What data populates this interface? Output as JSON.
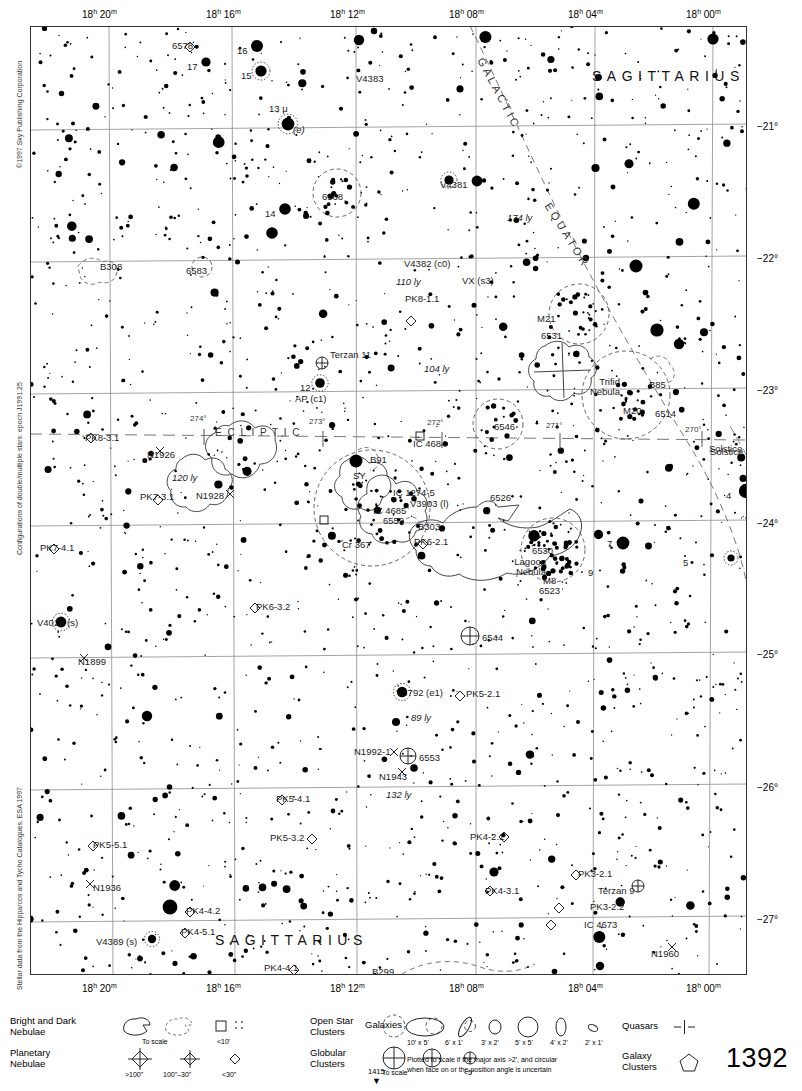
{
  "meta": {
    "page_number": "1392",
    "bottom_tiny_number": "1415",
    "copyright": "©1997 Sky Publishing Corporation",
    "credit_double_stars": "Configurations of double/multiple stars: epoch J1991.25",
    "credit_stellar_data": "Stellar data from the Hipparcos and Tycho Catalogues, ESA 1997"
  },
  "chart_data": {
    "type": "scatter",
    "xlabel": "Right Ascension",
    "ylabel": "Declination",
    "x_ticks": [
      "18h 20m",
      "18h 16m",
      "18h 12m",
      "18h 08m",
      "18h 04m",
      "18h 00m"
    ],
    "y_ticks": [
      "-21°",
      "-22°",
      "-23°",
      "-24°",
      "-25°",
      "-26°",
      "-27°"
    ],
    "xlim": [
      "18h 22m",
      "17h 59m"
    ],
    "ylim": [
      -27.4,
      -20.4
    ],
    "grid": true,
    "legend_position": "below-chart"
  },
  "ra_ticks": [
    {
      "label": "18",
      "sup_h": "h",
      "min": "20",
      "sup_m": "m",
      "x": 108
    },
    {
      "label": "18",
      "sup_h": "h",
      "min": "16",
      "sup_m": "m",
      "x": 232
    },
    {
      "label": "18",
      "sup_h": "h",
      "min": "12",
      "sup_m": "m",
      "x": 356
    },
    {
      "label": "18",
      "sup_h": "h",
      "min": "08",
      "sup_m": "m",
      "x": 475
    },
    {
      "label": "18",
      "sup_h": "h",
      "min": "04",
      "sup_m": "m",
      "x": 594
    },
    {
      "label": "18",
      "sup_h": "h",
      "min": "00",
      "sup_m": "m",
      "x": 712
    }
  ],
  "dec_ticks": [
    {
      "label": "−21°",
      "y": 127
    },
    {
      "label": "−22°",
      "y": 259
    },
    {
      "label": "−23°",
      "y": 391
    },
    {
      "label": "−24°",
      "y": 524
    },
    {
      "label": "−25°",
      "y": 655
    },
    {
      "label": "−26°",
      "y": 788
    },
    {
      "label": "−27°",
      "y": 920
    }
  ],
  "constellation_names": [
    {
      "text": "SAGITTARIUS",
      "x": 592,
      "y": 75
    },
    {
      "text": "SAGITTARIUS",
      "x": 215,
      "y": 939
    },
    {
      "text": "SAGITTARIUS",
      "x": 594,
      "y": 584
    }
  ],
  "great_circles": [
    {
      "name": "GALACTIC",
      "text": "GALACTIC"
    },
    {
      "name": "EQUATOR",
      "text": "EQUATOR"
    },
    {
      "name": "ECLIPTIC",
      "text": "E C L I P T I C"
    },
    {
      "name": "Solstice",
      "text": "Solstice"
    }
  ],
  "ecliptic_ticks": [
    "274°",
    "273°",
    "272°",
    "271°",
    "270°"
  ],
  "objects": [
    {
      "name": "6578",
      "x": 172,
      "y": 41,
      "kind": "planetary-nebula"
    },
    {
      "name": "16",
      "x": 237,
      "y": 46,
      "kind": "star-label"
    },
    {
      "name": "17",
      "x": 187,
      "y": 62,
      "kind": "star-label"
    },
    {
      "name": "15",
      "x": 241,
      "y": 71,
      "kind": "star-label"
    },
    {
      "name": "V4383",
      "x": 356,
      "y": 74,
      "kind": "variable-star"
    },
    {
      "name": "13 μ",
      "x": 269,
      "y": 104,
      "kind": "star-label"
    },
    {
      "name": "(e)",
      "x": 293,
      "y": 125,
      "kind": "note"
    },
    {
      "name": "−21°",
      "x": 760,
      "y": 127,
      "kind": "dec-label"
    },
    {
      "name": "V4381",
      "x": 440,
      "y": 180,
      "kind": "variable-star"
    },
    {
      "name": "6568",
      "x": 322,
      "y": 192,
      "kind": "open-cluster"
    },
    {
      "name": "14",
      "x": 265,
      "y": 209,
      "kind": "star-label"
    },
    {
      "name": "174 ly",
      "x": 507,
      "y": 213,
      "kind": "distance"
    },
    {
      "name": "B308",
      "x": 100,
      "y": 262,
      "kind": "dark-nebula"
    },
    {
      "name": "6583",
      "x": 186,
      "y": 266,
      "kind": "open-cluster"
    },
    {
      "name": "V4382 (c0)",
      "x": 404,
      "y": 259,
      "kind": "variable-star"
    },
    {
      "name": "VX (s3)",
      "x": 462,
      "y": 276,
      "kind": "variable-star"
    },
    {
      "name": "110 ly",
      "x": 396,
      "y": 277,
      "kind": "distance"
    },
    {
      "name": "PK8-1.1",
      "x": 405,
      "y": 294,
      "kind": "planetary-nebula"
    },
    {
      "name": "M21",
      "x": 537,
      "y": 314,
      "kind": "open-cluster"
    },
    {
      "name": "6531",
      "x": 541,
      "y": 331,
      "kind": "open-cluster"
    },
    {
      "name": "Terzan 11",
      "x": 330,
      "y": 350,
      "kind": "globular-cluster"
    },
    {
      "name": "104 ly",
      "x": 424,
      "y": 364,
      "kind": "distance"
    },
    {
      "name": "Trifid Nebula",
      "x": 574,
      "y": 377,
      "kind": "bright-nebula"
    },
    {
      "name": "B85",
      "x": 649,
      "y": 380,
      "kind": "dark-nebula"
    },
    {
      "name": "12",
      "x": 300,
      "y": 383,
      "kind": "star-label"
    },
    {
      "name": "AP (c1)",
      "x": 295,
      "y": 394,
      "kind": "variable-star"
    },
    {
      "name": "M20",
      "x": 623,
      "y": 406,
      "kind": "bright-nebula"
    },
    {
      "name": "6514",
      "x": 655,
      "y": 409,
      "kind": "bright-nebula"
    },
    {
      "name": "6546",
      "x": 494,
      "y": 422,
      "kind": "open-cluster"
    },
    {
      "name": "PK8-3.1",
      "x": 85,
      "y": 433,
      "kind": "planetary-nebula"
    },
    {
      "name": "IC 4684",
      "x": 413,
      "y": 439,
      "kind": "bright-nebula"
    },
    {
      "name": "Solstice",
      "x": 710,
      "y": 447,
      "kind": "annotation"
    },
    {
      "name": "N1926",
      "x": 147,
      "y": 450,
      "kind": "double-star"
    },
    {
      "name": "B91",
      "x": 370,
      "y": 455,
      "kind": "dark-nebula"
    },
    {
      "name": "SY",
      "x": 353,
      "y": 471,
      "kind": "variable-star"
    },
    {
      "name": "IC 1274-5",
      "x": 393,
      "y": 488,
      "kind": "bright-nebula"
    },
    {
      "name": "120 ly",
      "x": 172,
      "y": 473,
      "kind": "distance"
    },
    {
      "name": "N1928",
      "x": 196,
      "y": 491,
      "kind": "double-star"
    },
    {
      "name": "PK7-3.1",
      "x": 140,
      "y": 492,
      "kind": "planetary-nebula"
    },
    {
      "name": "V3903 (l)",
      "x": 410,
      "y": 499,
      "kind": "variable-star"
    },
    {
      "name": "IC 4685",
      "x": 373,
      "y": 506,
      "kind": "bright-nebula"
    },
    {
      "name": "6559",
      "x": 383,
      "y": 516,
      "kind": "bright-nebula"
    },
    {
      "name": "B303",
      "x": 418,
      "y": 522,
      "kind": "dark-nebula"
    },
    {
      "name": "6526",
      "x": 490,
      "y": 493,
      "kind": "bright-nebula"
    },
    {
      "name": "4",
      "x": 726,
      "y": 491,
      "kind": "star-label"
    },
    {
      "name": "PK7-4.1",
      "x": 40,
      "y": 543,
      "kind": "planetary-nebula"
    },
    {
      "name": "Cr 367",
      "x": 342,
      "y": 540,
      "kind": "open-cluster"
    },
    {
      "name": "PK6-2.1",
      "x": 414,
      "y": 537,
      "kind": "planetary-nebula"
    },
    {
      "name": "6530",
      "x": 532,
      "y": 546,
      "kind": "open-cluster"
    },
    {
      "name": "7",
      "x": 607,
      "y": 539,
      "kind": "star-label"
    },
    {
      "name": "9",
      "x": 588,
      "y": 568,
      "kind": "star-label"
    },
    {
      "name": "5",
      "x": 683,
      "y": 558,
      "kind": "star-label"
    },
    {
      "name": "Lagoon Nebula",
      "x": 500,
      "y": 557,
      "kind": "bright-nebula"
    },
    {
      "name": "M8",
      "x": 543,
      "y": 576,
      "kind": "bright-nebula"
    },
    {
      "name": "6523",
      "x": 539,
      "y": 586,
      "kind": "bright-nebula"
    },
    {
      "name": "PK6-3.2",
      "x": 256,
      "y": 602,
      "kind": "planetary-nebula"
    },
    {
      "name": "V4028 (s)",
      "x": 37,
      "y": 618,
      "kind": "variable-star"
    },
    {
      "name": "6544",
      "x": 482,
      "y": 633,
      "kind": "globular-cluster"
    },
    {
      "name": "N1899",
      "x": 78,
      "y": 657,
      "kind": "double-star"
    },
    {
      "name": "V3792 (e1)",
      "x": 396,
      "y": 688,
      "kind": "variable-star"
    },
    {
      "name": "PK5-2.1",
      "x": 466,
      "y": 689,
      "kind": "planetary-nebula"
    },
    {
      "name": "89 ly",
      "x": 411,
      "y": 713,
      "kind": "distance"
    },
    {
      "name": "N1992-1",
      "x": 354,
      "y": 747,
      "kind": "double-star"
    },
    {
      "name": "6553",
      "x": 419,
      "y": 753,
      "kind": "globular-cluster"
    },
    {
      "name": "N1943",
      "x": 379,
      "y": 772,
      "kind": "double-star"
    },
    {
      "name": "132 ly",
      "x": 386,
      "y": 790,
      "kind": "distance"
    },
    {
      "name": "PK5-4.1",
      "x": 276,
      "y": 794,
      "kind": "planetary-nebula"
    },
    {
      "name": "PK5-3.2",
      "x": 270,
      "y": 833,
      "kind": "planetary-nebula"
    },
    {
      "name": "PK5-5.1",
      "x": 93,
      "y": 840,
      "kind": "planetary-nebula"
    },
    {
      "name": "PK4-2.1",
      "x": 470,
      "y": 832,
      "kind": "planetary-nebula"
    },
    {
      "name": "PK3-2.1",
      "x": 578,
      "y": 869,
      "kind": "planetary-nebula"
    },
    {
      "name": "Terzan 9",
      "x": 598,
      "y": 886,
      "kind": "globular-cluster"
    },
    {
      "name": "N1936",
      "x": 93,
      "y": 883,
      "kind": "double-star"
    },
    {
      "name": "PK4-3.1",
      "x": 485,
      "y": 886,
      "kind": "planetary-nebula"
    },
    {
      "name": "PK3-2.2",
      "x": 590,
      "y": 902,
      "kind": "planetary-nebula"
    },
    {
      "name": "PK4-4.2",
      "x": 186,
      "y": 906,
      "kind": "planetary-nebula"
    },
    {
      "name": "IC 4673",
      "x": 584,
      "y": 920,
      "kind": "planetary-nebula"
    },
    {
      "name": "PK4-5.1",
      "x": 181,
      "y": 927,
      "kind": "planetary-nebula"
    },
    {
      "name": "V4389 (s)",
      "x": 96,
      "y": 937,
      "kind": "variable-star"
    },
    {
      "name": "N1960",
      "x": 651,
      "y": 949,
      "kind": "double-star"
    },
    {
      "name": "PK4-4.1",
      "x": 264,
      "y": 963,
      "kind": "planetary-nebula"
    },
    {
      "name": "B299",
      "x": 372,
      "y": 967,
      "kind": "dark-nebula"
    },
    {
      "name": "PK2-2.3",
      "x": 620,
      "y": 978,
      "kind": "planetary-nebula"
    },
    {
      "name": "N1910",
      "x": 690,
      "y": 978,
      "kind": "double-star"
    },
    {
      "name": "PK2-1.1",
      "x": 681,
      "y": 993,
      "kind": "planetary-nebula"
    }
  ],
  "legend": {
    "bright_dark_nebulae": "Bright and Dark\nNebulae",
    "bright_dark_to_scale": "To scale",
    "bright_dark_small": "<10'",
    "planetary_nebulae": "Planetary\nNebulae",
    "planetary_sizes": [
      ">100\"",
      "100\"–30\"",
      "<30\""
    ],
    "open_star_clusters": "Open Star\nClusters",
    "globular_clusters": "Globular\nClusters",
    "globular_to_scale": "To scale",
    "globular_small": "<5'",
    "galaxies": "Galaxies",
    "galaxy_sizes": [
      "10' x 5'",
      "6' x 1'",
      "3' x 2'",
      "5' x 5'",
      "4' x 2'",
      "2' x 1'"
    ],
    "galaxy_note": "Plotted to scale if the major axis >2', and circular\nwhen face on or the position angle is uncertain",
    "quasars": "Quasars",
    "galaxy_clusters": "Galaxy\nClusters"
  }
}
